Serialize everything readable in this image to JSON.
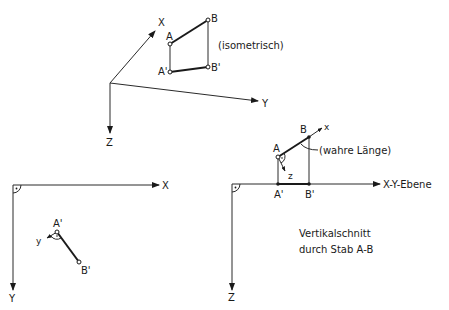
{
  "diagram": {
    "isometric_view": {
      "caption": "(isometrisch)",
      "axes": {
        "x": "X",
        "y": "Y",
        "z": "Z"
      },
      "points": {
        "a": "A",
        "b": "B",
        "a_prime": "A'",
        "b_prime": "B'"
      }
    },
    "top_view": {
      "axes": {
        "x": "X",
        "y": "Y"
      },
      "points": {
        "a_prime": "A'",
        "b_prime": "B'"
      },
      "local_axis": "y"
    },
    "vertical_section": {
      "axis_label": "X-Y-Ebene",
      "z_axis": "Z",
      "points": {
        "a": "A",
        "b": "B",
        "a_prime": "A'",
        "b_prime": "B'"
      },
      "local_axes": {
        "x": "x",
        "z": "z"
      },
      "true_length_label": "(wahre Länge)",
      "caption_line1": "Vertikalschnitt",
      "caption_line2": "durch Stab A-B"
    }
  }
}
